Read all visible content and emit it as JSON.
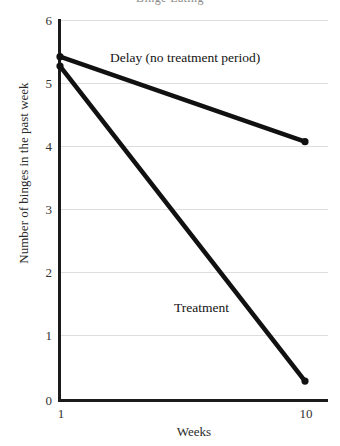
{
  "chart_data": {
    "type": "line",
    "title": "Binge Eating",
    "xlabel": "Weeks",
    "ylabel": "Number of binges in the past week",
    "x": [
      1,
      10
    ],
    "xticks": [
      "1",
      "10"
    ],
    "yticks": [
      "0",
      "1",
      "2",
      "3",
      "4",
      "5",
      "6"
    ],
    "ylim": [
      0,
      6
    ],
    "xlim": [
      1,
      10
    ],
    "grid": true,
    "legend_position": "inline-annotations",
    "series": [
      {
        "name": "Delay (no treatment period)",
        "values": [
          5.45,
          4.1
        ],
        "color": "#111111",
        "marker": "circle"
      },
      {
        "name": "Treatment",
        "values": [
          5.3,
          0.3
        ],
        "color": "#111111",
        "marker": "circle"
      }
    ],
    "annotations": [
      {
        "text": "Delay (no treatment period)"
      },
      {
        "text": "Treatment"
      }
    ]
  }
}
